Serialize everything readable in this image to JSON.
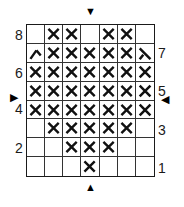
{
  "puzzle": {
    "columns": 7,
    "rows": 8,
    "row_labels_left": [
      {
        "row": 8,
        "label": "8"
      },
      {
        "row": 6,
        "label": "6"
      },
      {
        "row": 4,
        "label": "4"
      },
      {
        "row": 2,
        "label": "2"
      }
    ],
    "row_labels_right": [
      {
        "row": 7,
        "label": "7"
      },
      {
        "row": 5,
        "label": "5"
      },
      {
        "row": 3,
        "label": "3"
      },
      {
        "row": 1,
        "label": "1"
      }
    ],
    "arrows": {
      "top": "▼",
      "bottom": "▲",
      "left": "▶",
      "right": "◀"
    },
    "cells": [
      [
        "",
        "X",
        "X",
        "",
        "X",
        "X",
        ""
      ],
      [
        "partial-left",
        "X",
        "X",
        "X",
        "X",
        "X",
        "partial-right"
      ],
      [
        "X",
        "X",
        "X",
        "X",
        "X",
        "X",
        "X"
      ],
      [
        "X",
        "X",
        "X",
        "X",
        "X",
        "X",
        "X"
      ],
      [
        "X",
        "X",
        "X",
        "X",
        "X",
        "X",
        "X"
      ],
      [
        "",
        "X",
        "X",
        "X",
        "X",
        "X",
        ""
      ],
      [
        "",
        "",
        "X",
        "X",
        "X",
        "",
        ""
      ],
      [
        "",
        "",
        "",
        "X",
        "",
        "",
        ""
      ]
    ],
    "mark_color": "#111111",
    "grid_color": "#1a1a1a"
  }
}
